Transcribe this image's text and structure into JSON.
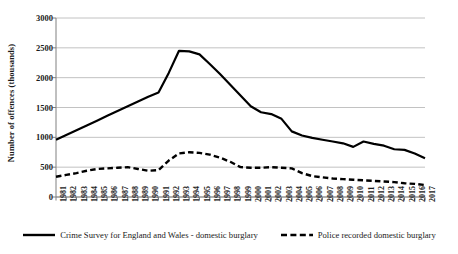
{
  "chart_data": {
    "type": "line",
    "title": "",
    "xlabel": "",
    "ylabel": "Number of offences (thousands)",
    "ylim": [
      0,
      3000
    ],
    "ytick_step": 500,
    "yticks": [
      "0",
      "500",
      "1000",
      "1500",
      "2000",
      "2500",
      "3000"
    ],
    "grid": true,
    "legend_position": "bottom",
    "colors": {
      "line": "#000000",
      "grid": "#b3b3b3",
      "axis": "#808080",
      "text": "#1a1a1a"
    },
    "categories": [
      "1981",
      "1982",
      "1983",
      "1984",
      "1985",
      "1986",
      "1987",
      "1988",
      "1989",
      "1990",
      "1991",
      "1992",
      "1993",
      "1994",
      "1995",
      "1996",
      "1997",
      "1998",
      "1999",
      "2000",
      "2001",
      "2002",
      "2003",
      "2004",
      "2005",
      "2006",
      "2007",
      "2008",
      "2009",
      "2010",
      "2011",
      "2012",
      "2013",
      "2014",
      "2015",
      "2016",
      "2017"
    ],
    "series": [
      {
        "name": "Crime Survey for England and Wales - domestic burglary",
        "style": "solid",
        "values": [
          960,
          1040,
          1120,
          1200,
          1280,
          1360,
          1440,
          1520,
          1600,
          1680,
          1750,
          2080,
          2450,
          2440,
          2390,
          2230,
          2060,
          1880,
          1700,
          1520,
          1420,
          1390,
          1310,
          1100,
          1030,
          990,
          960,
          930,
          900,
          840,
          930,
          890,
          860,
          800,
          790,
          730,
          650
        ]
      },
      {
        "name": "Police recorded domestic burglary",
        "style": "dashed",
        "values": [
          340,
          370,
          400,
          440,
          470,
          480,
          490,
          500,
          470,
          440,
          450,
          610,
          730,
          750,
          740,
          710,
          660,
          590,
          500,
          490,
          490,
          500,
          490,
          480,
          400,
          350,
          330,
          310,
          300,
          290,
          280,
          270,
          260,
          250,
          230,
          220,
          200
        ]
      }
    ]
  },
  "legend": {
    "entries": [
      {
        "label": "Crime Survey for England and Wales - domestic burglary",
        "style": "solid"
      },
      {
        "label": "Police recorded domestic burglary",
        "style": "dashed"
      }
    ]
  }
}
